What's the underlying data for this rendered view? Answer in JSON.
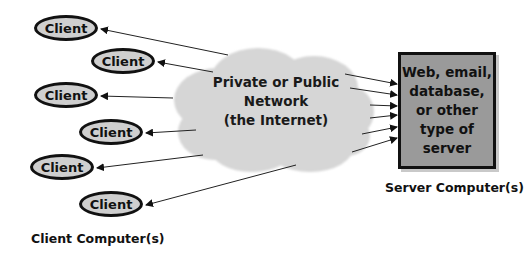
{
  "clients": [
    {
      "label": "Client",
      "x": 34,
      "y": 15
    },
    {
      "label": "Client",
      "x": 91,
      "y": 48
    },
    {
      "label": "Client",
      "x": 34,
      "y": 82
    },
    {
      "label": "Client",
      "x": 79,
      "y": 119
    },
    {
      "label": "Client",
      "x": 30,
      "y": 154
    },
    {
      "label": "Client",
      "x": 79,
      "y": 191
    }
  ],
  "network": {
    "label": "Private or Public\nNetwork\n(the Internet)",
    "line1": "Private or Public",
    "line2": "Network",
    "line3": "(the Internet)",
    "fill_color": "#d6d6d6"
  },
  "server": {
    "label": "Web, email,\ndatabase,\nor other\ntype of\nserver",
    "fill_color": "#9a9a9a"
  },
  "captions": {
    "server": "Server Computer(s)",
    "clients": "Client Computer(s)"
  }
}
